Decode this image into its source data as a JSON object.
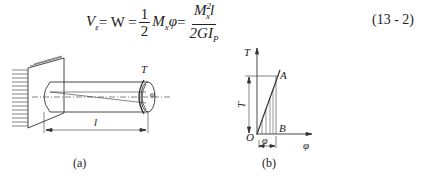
{
  "equation": {
    "lhs": "V",
    "lhs_sub": "ε",
    "eq1": " = W = ",
    "half_num": "1",
    "half_den": "2",
    "mid": "M",
    "mid_sub": "x",
    "mid_var": "φ",
    "eq2": " = ",
    "frac_num_M": "M",
    "frac_num_sup": "2",
    "frac_num_sub": "x",
    "frac_num_l": "l",
    "frac_den": "2GI",
    "frac_den_sub": "P",
    "number": "(13 - 2)"
  },
  "figure_a": {
    "caption": "(a)",
    "torque_label": "T",
    "angle_label": "φ",
    "length_label": "l"
  },
  "figure_b": {
    "caption": "(b)",
    "y_axis_label": "T",
    "x_axis_label": "φ",
    "origin_label": "O",
    "point_a_label": "A",
    "point_b_label": "B",
    "height_dim_label": "T",
    "width_dim_label": "φ"
  }
}
